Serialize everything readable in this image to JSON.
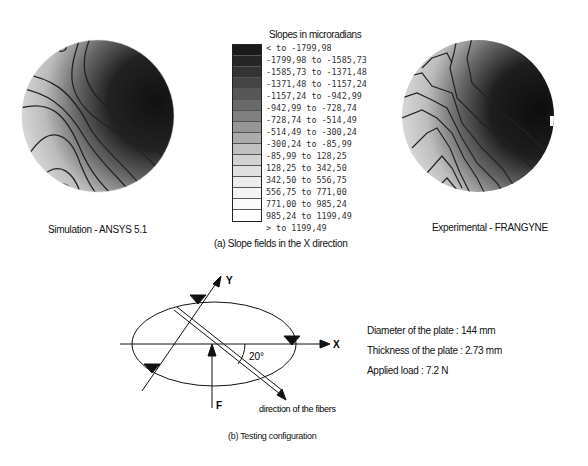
{
  "legend": {
    "title": "Slopes in microradians",
    "ranges": [
      "< to -1799,98",
      "-1799,98 to -1585,73",
      "-1585,73 to -1371,48",
      "-1371,48 to -1157,24",
      "-1157,24 to -942,99",
      "-942,99 to -728,74",
      "-728,74 to -514,49",
      "-514,49 to -300,24",
      "-300,24 to -85,99",
      "-85,99 to 128,25",
      "128,25 to 342,50",
      "342,50 to 556,75",
      "556,75 to 771,00",
      "771,00 to 985,24",
      "985,24 to 1199,49",
      "> to 1199,49"
    ],
    "colors": [
      "#1a1a1a",
      "#262626",
      "#333333",
      "#444444",
      "#575757",
      "#6a6a6a",
      "#808080",
      "#969696",
      "#ababab",
      "#c0c0c0",
      "#d2d2d2",
      "#e0e0e0",
      "#ececec",
      "#f4f4f4",
      "#fafafa",
      "#ffffff"
    ]
  },
  "panel_a": {
    "left_label": "Simulation - ANSYS 5.1",
    "right_label": "Experimental - FRANGYNE",
    "caption": "(a) Slope fields in the X direction"
  },
  "panel_b": {
    "axis_x": "X",
    "axis_y": "Y",
    "force": "F",
    "angle": "20°",
    "fiber_label": "direction of the fibers",
    "caption": "(b) Testing configuration",
    "specs": [
      "Diameter of the plate : 144 mm",
      "Thickness of the plate : 2.73 mm",
      "Applied load : 7.2 N"
    ]
  }
}
